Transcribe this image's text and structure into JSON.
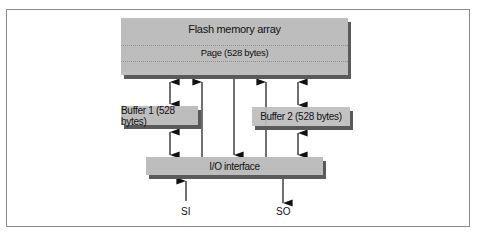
{
  "diagram": {
    "flash_array": {
      "title": "Flash memory array",
      "page_label": "Page (528 bytes)"
    },
    "buffer1": {
      "label": "Buffer 1 (528 bytes)"
    },
    "buffer2": {
      "label": "Buffer 2 (528 bytes)"
    },
    "io_interface": {
      "label": "I/O interface"
    },
    "signals": {
      "input": "SI",
      "output": "SO"
    },
    "colors": {
      "box_fill": "#bdbdbd",
      "box_shadow": "#5a5a5a",
      "frame_border": "#8a8a8a",
      "line": "#111111"
    }
  }
}
